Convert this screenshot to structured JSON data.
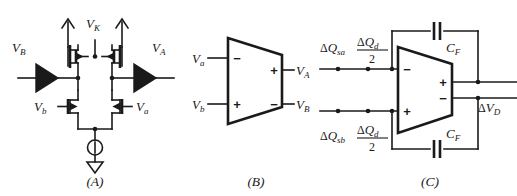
{
  "figure": {
    "background_color": "#ffffff",
    "line_color": "#1a1a1a"
  },
  "captions": {
    "a": "(A)",
    "b": "(B)",
    "c": "(C)"
  },
  "panel_a": {
    "name": "transistor-level-differential-amplifier",
    "labels": {
      "vk": "V",
      "vk_sub": "K",
      "vb_in": "V",
      "vb_in_sub": "B",
      "va_out": "V",
      "va_out_sub": "A",
      "vb_gate": "V",
      "vb_gate_sub": "b",
      "va_gate": "V",
      "va_gate_sub": "a"
    },
    "components": {
      "pmos_left": "pmos-transistor-left",
      "pmos_right": "pmos-transistor-right",
      "nmos_left": "nmos-transistor-left",
      "nmos_right": "nmos-transistor-right",
      "buffer_left": "buffer-triangle-left",
      "buffer_right": "buffer-triangle-right",
      "current_source": "current-source",
      "ground": "ground-symbol"
    }
  },
  "panel_b": {
    "name": "differential-amplifier-symbol",
    "inputs": [
      {
        "label": "V",
        "sub": "a",
        "sign": "−"
      },
      {
        "label": "V",
        "sub": "b",
        "sign": "+"
      }
    ],
    "outputs": [
      {
        "label": "V",
        "sub": "A",
        "sign": "+"
      },
      {
        "label": "V",
        "sub": "B",
        "sign": "−"
      }
    ]
  },
  "panel_c": {
    "name": "charge-amplifier-with-feedback-capacitors",
    "input_labels": {
      "top_source": {
        "delta": "Δ",
        "q": "Q",
        "sub": "sa"
      },
      "top_frac_num": {
        "delta": "Δ",
        "q": "Q",
        "sub": "d"
      },
      "top_frac_den": "2",
      "bottom_source": {
        "delta": "Δ",
        "q": "Q",
        "sub": "sb"
      },
      "bottom_frac_num": {
        "delta": "Δ",
        "q": "Q",
        "sub": "d"
      },
      "bottom_frac_den": "2"
    },
    "feedback": {
      "top_cap_label": "C",
      "top_cap_sub": "F",
      "bottom_cap_label": "C",
      "bottom_cap_sub": "F"
    },
    "amp_signs": {
      "in_top": "−",
      "in_bottom": "+",
      "out_top": "+",
      "out_bottom": "−"
    },
    "output_label": {
      "delta": "Δ",
      "v": "V",
      "sub": "D"
    }
  }
}
